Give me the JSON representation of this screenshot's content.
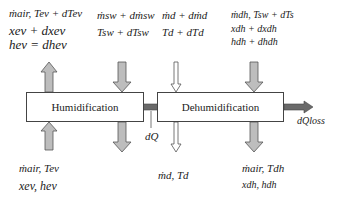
{
  "diagram": {
    "type": "process-flow",
    "boxes": {
      "humidification": "Humidification",
      "dehumidification": "Dehumidification"
    },
    "inputs_top": {
      "evaporator_air": {
        "line1": "ṁair, Tev + dTev",
        "line2": "xev + dxev",
        "line3": "hev = dhev"
      },
      "seawater": {
        "line1": "ṁsw + dṁsw",
        "line2": "Tsw + dTsw"
      },
      "distillate": {
        "line1": "ṁd + dṁd",
        "line2": "Td + dTd"
      },
      "dehumidifier_air": {
        "line1": "ṁdh, Tsw + dTs",
        "line2": "xdh + dxdh",
        "line3": "hdh + dhdh"
      }
    },
    "outputs_bottom": {
      "evaporator_air": {
        "line1": "ṁair, Tev",
        "line2": "xev, hev"
      },
      "distillate": {
        "line1": "ṁd, Td"
      },
      "dehumidifier_air": {
        "line1": "ṁair, Tdh",
        "line2": "xdh, hdh"
      }
    },
    "heat_transfer": {
      "internal": "dQ",
      "loss": "dQloss"
    },
    "colors": {
      "arrow_fill": "#bdbdbd",
      "arrow_stroke": "#555555",
      "heat_arrow_fill": "#666666",
      "box_border": "#444444"
    }
  }
}
